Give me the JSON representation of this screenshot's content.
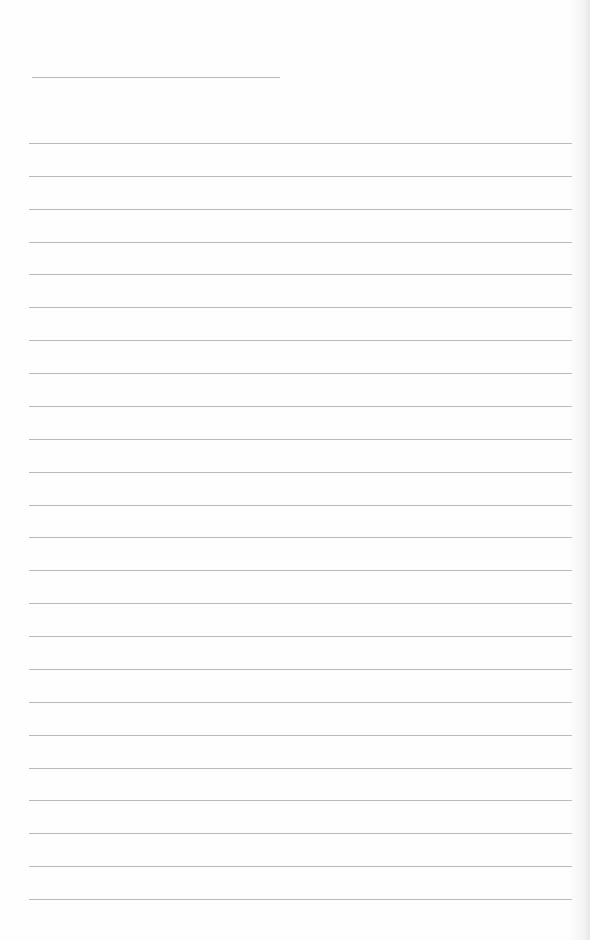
{
  "document": {
    "type": "blank lined notebook page",
    "background_color": "#fefefe",
    "line_color": "#b9b9b9",
    "header_line": {
      "x": 32,
      "y": 77,
      "width": 248
    },
    "ruled_lines": {
      "count": 24,
      "first_y": 143,
      "spacing": 32.87,
      "x": 29,
      "width": 543
    },
    "bleed_through_text": ""
  }
}
